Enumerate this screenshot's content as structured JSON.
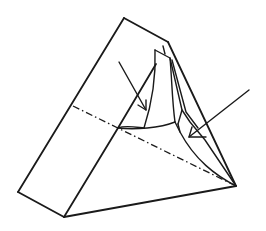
{
  "figure": {
    "type": "line-drawing",
    "background": "#ffffff",
    "stroke_color": "#1a1a1a",
    "annotations": {
      "arrows": [
        {
          "name": "left-arrow",
          "from": [
            119,
            62
          ],
          "to": [
            146,
            110
          ]
        },
        {
          "name": "right-arrow",
          "from": [
            249,
            90
          ],
          "to": [
            189,
            137
          ]
        }
      ],
      "fold_line": {
        "style": "dash-dot",
        "from": [
          73,
          106
        ],
        "to": [
          234,
          185
        ]
      }
    },
    "labels": []
  }
}
